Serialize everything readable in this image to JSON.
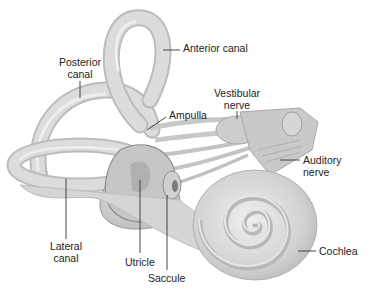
{
  "figure": {
    "background": "#ffffff",
    "structure_fill": "#d9d9d9",
    "structure_shade": "#b5b5b5",
    "structure_highlight": "#ececec",
    "leader_color": "#333333",
    "text_color": "#222222"
  },
  "labels": {
    "anterior_canal": "Anterior canal",
    "posterior_canal_line1": "Posterior",
    "posterior_canal_line2": "canal",
    "ampulla": "Ampulla",
    "vestibular_nerve_line1": "Vestibular",
    "vestibular_nerve_line2": "nerve",
    "auditory_nerve_line1": "Auditory",
    "auditory_nerve_line2": "nerve",
    "lateral_canal_line1": "Lateral",
    "lateral_canal_line2": "canal",
    "utricle": "Utricle",
    "saccule": "Saccule",
    "cochlea": "Cochlea"
  }
}
